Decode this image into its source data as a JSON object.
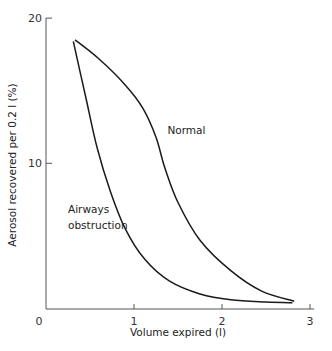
{
  "chart_data": {
    "type": "line",
    "title": "",
    "xlabel": "Volume expired (l)",
    "ylabel": "Aerosol recovered per 0.2 l (%)",
    "xlim": [
      0,
      3
    ],
    "ylim": [
      0,
      20
    ],
    "xticks": [
      0,
      1,
      2,
      3
    ],
    "xtick_labels": [
      "0",
      "1",
      "2",
      "3"
    ],
    "yticks": [
      10,
      20
    ],
    "ytick_labels": [
      "10",
      "20"
    ],
    "grid": false,
    "legend": null,
    "series": [
      {
        "name": "Normal",
        "x": [
          0.33,
          0.6,
          0.9,
          1.1,
          1.25,
          1.35,
          1.5,
          1.75,
          2.1,
          2.45,
          2.82
        ],
        "y": [
          18.5,
          17.2,
          15.4,
          13.8,
          11.8,
          9.7,
          7.3,
          4.7,
          2.6,
          1.2,
          0.5
        ]
      },
      {
        "name": "Airways obstruction",
        "x": [
          0.31,
          0.45,
          0.58,
          0.73,
          0.9,
          1.12,
          1.4,
          1.75,
          2.1,
          2.5,
          2.8
        ],
        "y": [
          18.4,
          14.6,
          11.1,
          8.1,
          5.5,
          3.4,
          1.9,
          1.0,
          0.6,
          0.45,
          0.4
        ]
      }
    ],
    "annotations": [
      {
        "text": "Normal",
        "x": 1.38,
        "y": 12.0
      },
      {
        "text": "Airways",
        "x": 0.25,
        "y": 6.6
      },
      {
        "text": "obstruction",
        "x": 0.25,
        "y": 5.5
      }
    ]
  }
}
